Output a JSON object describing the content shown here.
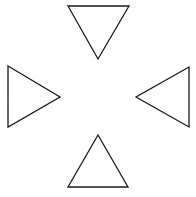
{
  "diagram": {
    "width": 196,
    "height": 197,
    "background": "#ffffff",
    "stroke": "#1a1a1a",
    "stroke_width": 1.3,
    "fill": "#ffffff",
    "shapes": [
      {
        "name": "triangle-top-pointing-down",
        "direction": "down",
        "points": [
          [
            68,
            6
          ],
          [
            129,
            6
          ],
          [
            98,
            59
          ]
        ]
      },
      {
        "name": "triangle-left-pointing-right",
        "direction": "right",
        "points": [
          [
            8,
            66
          ],
          [
            60,
            97
          ],
          [
            8,
            127
          ]
        ]
      },
      {
        "name": "triangle-right-pointing-left",
        "direction": "left",
        "points": [
          [
            189,
            67
          ],
          [
            136,
            97
          ],
          [
            189,
            127
          ]
        ]
      },
      {
        "name": "triangle-bottom-pointing-up",
        "direction": "up",
        "points": [
          [
            98,
            135
          ],
          [
            128,
            187
          ],
          [
            68,
            187
          ]
        ]
      }
    ]
  }
}
